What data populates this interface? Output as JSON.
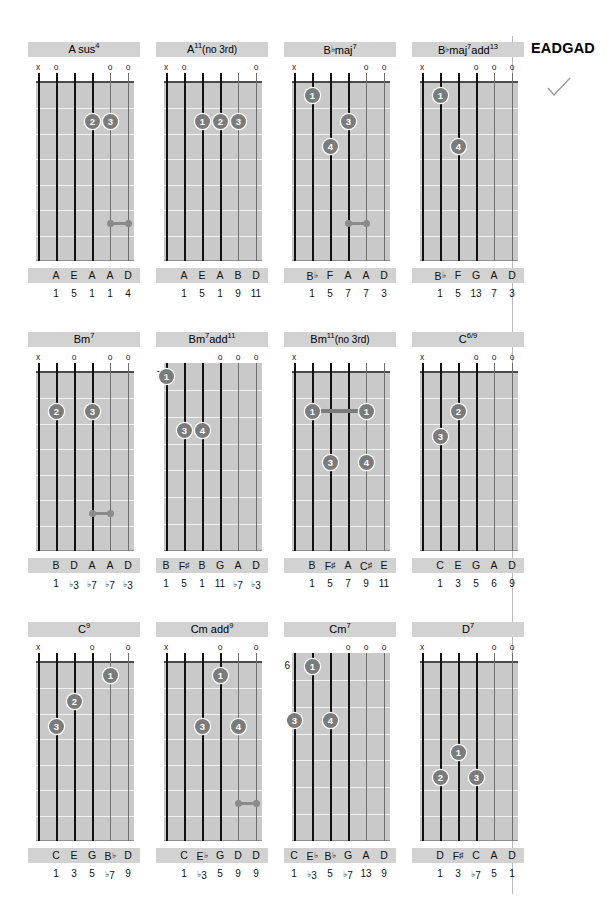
{
  "tuning_label": "EADGAD",
  "check_icon": "checkmark-icon",
  "colors": {
    "board": "#c9c9c9",
    "band": "#d2d2d2",
    "dot": "#7b7b7b",
    "string": "#1a1a1a",
    "rule": "#b9b9b9"
  },
  "layout": {
    "string_count": 6,
    "fret_count": 7,
    "card_cols": 4,
    "card_rows": 3
  },
  "chords": [
    {
      "name": "A sus4",
      "name_base": "A sus",
      "name_sup": "4",
      "name_paren": "",
      "start_fret": null,
      "has_nut": true,
      "markers": [
        "x",
        "o",
        "",
        "",
        "o",
        "o"
      ],
      "dots": [
        {
          "string": 3,
          "fret": 2,
          "finger": "2"
        },
        {
          "string": 4,
          "fret": 2,
          "finger": "3"
        }
      ],
      "barres": [],
      "bells": [
        {
          "fret": 6,
          "from_string": 4,
          "to_string": 5
        }
      ],
      "notes": [
        "",
        "A",
        "E",
        "A",
        "A",
        "D"
      ],
      "degrees": [
        "",
        "1",
        "5",
        "1",
        "1",
        "4"
      ]
    },
    {
      "name": "A11(no 3rd)",
      "name_base": "A",
      "name_sup": "11",
      "name_paren": "(no 3rd)",
      "start_fret": null,
      "has_nut": true,
      "markers": [
        "x",
        "o",
        "",
        "",
        "",
        "o"
      ],
      "dots": [
        {
          "string": 2,
          "fret": 2,
          "finger": "1"
        },
        {
          "string": 3,
          "fret": 2,
          "finger": "2"
        },
        {
          "string": 4,
          "fret": 2,
          "finger": "3"
        }
      ],
      "barres": [],
      "bells": [],
      "notes": [
        "",
        "A",
        "E",
        "A",
        "B",
        "D"
      ],
      "degrees": [
        "",
        "1",
        "5",
        "1",
        "9",
        "11"
      ]
    },
    {
      "name": "B♭maj7",
      "name_base": "B♭maj",
      "name_sup": "7",
      "name_paren": "",
      "start_fret": null,
      "has_nut": true,
      "markers": [
        "x",
        "",
        "",
        "",
        "o",
        "o"
      ],
      "dots": [
        {
          "string": 1,
          "fret": 1,
          "finger": "1"
        },
        {
          "string": 3,
          "fret": 2,
          "finger": "3"
        },
        {
          "string": 2,
          "fret": 3,
          "finger": "4"
        }
      ],
      "barres": [],
      "bells": [
        {
          "fret": 6,
          "from_string": 3,
          "to_string": 4
        }
      ],
      "notes": [
        "",
        "B♭",
        "F",
        "A",
        "A",
        "D"
      ],
      "degrees": [
        "",
        "1",
        "5",
        "7",
        "7",
        "3"
      ]
    },
    {
      "name": "B♭maj7add13",
      "name_base": "B♭maj",
      "name_sup": "7",
      "name_base2": "add",
      "name_sup2": "13",
      "name_paren": "",
      "start_fret": null,
      "has_nut": true,
      "markers": [
        "x",
        "",
        "",
        "o",
        "o",
        "o"
      ],
      "dots": [
        {
          "string": 1,
          "fret": 1,
          "finger": "1"
        },
        {
          "string": 2,
          "fret": 3,
          "finger": "4"
        }
      ],
      "barres": [],
      "bells": [],
      "notes": [
        "",
        "B♭",
        "F",
        "G",
        "A",
        "D"
      ],
      "degrees": [
        "",
        "1",
        "5",
        "13",
        "7",
        "3"
      ]
    },
    {
      "name": "Bm7",
      "name_base": "Bm",
      "name_sup": "7",
      "name_paren": "",
      "start_fret": null,
      "has_nut": true,
      "markers": [
        "x",
        "",
        "o",
        "",
        "o",
        "o"
      ],
      "dots": [
        {
          "string": 1,
          "fret": 2,
          "finger": "2"
        },
        {
          "string": 3,
          "fret": 2,
          "finger": "3"
        }
      ],
      "barres": [],
      "bells": [
        {
          "fret": 6,
          "from_string": 3,
          "to_string": 4
        }
      ],
      "notes": [
        "",
        "B",
        "D",
        "A",
        "A",
        "D"
      ],
      "degrees": [
        "",
        "1",
        "♭3",
        "♭7",
        "♭7",
        "♭3"
      ]
    },
    {
      "name": "Bm7add11",
      "name_base": "Bm",
      "name_sup": "7",
      "name_base2": "add",
      "name_sup2": "11",
      "name_paren": "",
      "start_fret": "7",
      "has_nut": false,
      "markers": [
        "",
        "",
        "",
        "o",
        "o",
        "o"
      ],
      "dots": [
        {
          "string": 0,
          "fret": 1,
          "finger": "1"
        },
        {
          "string": 1,
          "fret": 3,
          "finger": "3"
        },
        {
          "string": 2,
          "fret": 3,
          "finger": "4"
        }
      ],
      "barres": [],
      "bells": [],
      "notes": [
        "B",
        "F♯",
        "B",
        "G",
        "A",
        "D"
      ],
      "degrees": [
        "1",
        "5",
        "1",
        "11",
        "♭7",
        "♭3"
      ]
    },
    {
      "name": "Bm11(no 3rd)",
      "name_base": "Bm",
      "name_sup": "11",
      "name_paren": "(no 3rd)",
      "start_fret": null,
      "has_nut": true,
      "markers": [
        "x",
        "",
        "",
        "",
        "",
        ""
      ],
      "dots": [
        {
          "string": 1,
          "fret": 2,
          "finger": "1"
        },
        {
          "string": 4,
          "fret": 2,
          "finger": "1"
        },
        {
          "string": 2,
          "fret": 4,
          "finger": "3"
        },
        {
          "string": 4,
          "fret": 4,
          "finger": "4"
        }
      ],
      "barres": [
        {
          "fret": 2,
          "from_string": 1,
          "to_string": 4
        }
      ],
      "bells": [],
      "notes": [
        "",
        "B",
        "F♯",
        "A",
        "C♯",
        "E"
      ],
      "degrees": [
        "",
        "1",
        "5",
        "7",
        "9",
        "11"
      ]
    },
    {
      "name": "C6/9",
      "name_base": "C",
      "name_sup": "6/9",
      "name_paren": "",
      "start_fret": null,
      "has_nut": true,
      "markers": [
        "x",
        "",
        "",
        "o",
        "o",
        "o"
      ],
      "dots": [
        {
          "string": 2,
          "fret": 2,
          "finger": "2"
        },
        {
          "string": 1,
          "fret": 3,
          "finger": "3"
        }
      ],
      "barres": [],
      "bells": [],
      "notes": [
        "",
        "C",
        "E",
        "G",
        "A",
        "D"
      ],
      "degrees": [
        "",
        "1",
        "3",
        "5",
        "6",
        "9"
      ]
    },
    {
      "name": "C9",
      "name_base": "C",
      "name_sup": "9",
      "name_paren": "",
      "start_fret": null,
      "has_nut": true,
      "markers": [
        "x",
        "",
        "",
        "o",
        "",
        "o"
      ],
      "dots": [
        {
          "string": 4,
          "fret": 1,
          "finger": "1"
        },
        {
          "string": 2,
          "fret": 2,
          "finger": "2"
        },
        {
          "string": 1,
          "fret": 3,
          "finger": "3"
        }
      ],
      "barres": [],
      "bells": [],
      "notes": [
        "",
        "C",
        "E",
        "G",
        "B♭",
        "D"
      ],
      "degrees": [
        "",
        "1",
        "3",
        "5",
        "♭7",
        "9"
      ]
    },
    {
      "name": "Cm add9",
      "name_base": "Cm add",
      "name_sup": "9",
      "name_paren": "",
      "start_fret": null,
      "has_nut": true,
      "markers": [
        "x",
        "",
        "",
        "o",
        "",
        "o"
      ],
      "dots": [
        {
          "string": 3,
          "fret": 1,
          "finger": "1"
        },
        {
          "string": 2,
          "fret": 3,
          "finger": "3"
        },
        {
          "string": 4,
          "fret": 3,
          "finger": "4"
        }
      ],
      "barres": [],
      "bells": [
        {
          "fret": 6,
          "from_string": 4,
          "to_string": 5
        }
      ],
      "notes": [
        "",
        "C",
        "E♭",
        "G",
        "D",
        "D"
      ],
      "degrees": [
        "",
        "1",
        "♭3",
        "5",
        "9",
        "9"
      ]
    },
    {
      "name": "Cm7",
      "name_base": "Cm",
      "name_sup": "7",
      "name_paren": "",
      "start_fret": "6",
      "has_nut": false,
      "markers": [
        "",
        "",
        "",
        "o",
        "o",
        "o"
      ],
      "dots": [
        {
          "string": 1,
          "fret": 1,
          "finger": "1"
        },
        {
          "string": 0,
          "fret": 3,
          "finger": "3"
        },
        {
          "string": 2,
          "fret": 3,
          "finger": "4"
        }
      ],
      "barres": [],
      "bells": [],
      "notes": [
        "C",
        "E♭",
        "B♭",
        "G",
        "A",
        "D"
      ],
      "degrees": [
        "1",
        "♭3",
        "5",
        "♭7",
        "13",
        "9"
      ]
    },
    {
      "name": "D7",
      "name_base": "D",
      "name_sup": "7",
      "name_paren": "",
      "start_fret": null,
      "has_nut": true,
      "markers": [
        "x",
        "",
        "",
        "",
        "o",
        "o"
      ],
      "dots": [
        {
          "string": 2,
          "fret": 4,
          "finger": "1"
        },
        {
          "string": 1,
          "fret": 5,
          "finger": "2"
        },
        {
          "string": 3,
          "fret": 5,
          "finger": "3"
        }
      ],
      "barres": [],
      "bells": [],
      "notes": [
        "",
        "D",
        "F♯",
        "C",
        "A",
        "D"
      ],
      "degrees": [
        "",
        "1",
        "3",
        "♭7",
        "5",
        "1"
      ]
    }
  ]
}
